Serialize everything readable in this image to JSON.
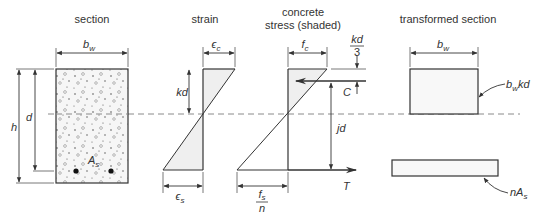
{
  "diagram": {
    "panels": [
      {
        "id": "section",
        "title": "section"
      },
      {
        "id": "strain",
        "title": "strain"
      },
      {
        "id": "stress",
        "title_line1": "concrete",
        "title_line2": "stress (shaded)"
      },
      {
        "id": "transformed",
        "title": "transformed section"
      }
    ],
    "section": {
      "width_label": "b",
      "width_sub": "w",
      "depth_label": "d",
      "height_label": "h",
      "steel_label": "A",
      "steel_sub": "s"
    },
    "strain": {
      "top_label": "ϵ",
      "top_sub": "c",
      "bottom_label": "ϵ",
      "bottom_sub": "s",
      "na_depth_label": "kd"
    },
    "stress": {
      "top_label": "f",
      "top_sub": "c",
      "bottom_num": "f",
      "bottom_num_sub": "s",
      "bottom_den": "n",
      "compression_label": "C",
      "tension_label": "T",
      "lever_arm_label": "jd",
      "kd3_num": "kd",
      "kd3_den": "3"
    },
    "transformed": {
      "width_label": "b",
      "width_sub": "w",
      "concrete_area_label": "b",
      "concrete_area_sub": "w",
      "concrete_area_suffix": "kd",
      "steel_area_prefix": "nA",
      "steel_area_sub": "s"
    },
    "colors": {
      "line": "#333333",
      "shade": "#efefef",
      "dash": "#8a8a8a"
    }
  }
}
